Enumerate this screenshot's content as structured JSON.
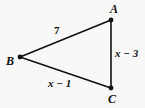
{
  "figure": {
    "background_color": "#f8f8f8",
    "stroke_color": "#111111",
    "vertices": [
      {
        "name": "A",
        "label": "A",
        "x": 111,
        "y": 20
      },
      {
        "name": "B",
        "label": "B",
        "x": 20,
        "y": 57
      },
      {
        "name": "C",
        "label": "C",
        "x": 111,
        "y": 88
      }
    ],
    "sides": [
      {
        "name": "AB",
        "from": "A",
        "to": "B",
        "label": "7"
      },
      {
        "name": "AC",
        "from": "A",
        "to": "C",
        "label": "x − 3"
      },
      {
        "name": "BC",
        "from": "B",
        "to": "C",
        "label": "x − 1"
      }
    ]
  }
}
